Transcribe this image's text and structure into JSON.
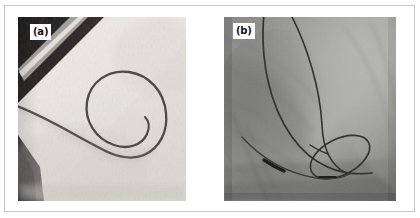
{
  "figure": {
    "panel_a": {
      "label": "(a)",
      "description": "pigtail catheter laid on a light surgical drape",
      "background_color": "#e7e4e0",
      "catheter_color": "#4a4642",
      "dark_band_color": "#1d1c1b"
    },
    "panel_b": {
      "label": "(b)",
      "description": "fluoroscopic image of catheter in situ with radiopaque markers",
      "background_color": "#8d8d8a",
      "catheter_color": "#2b2a29",
      "marker_color": "#141414"
    },
    "frame_color": "#c8c8c8",
    "page_background": "#ffffff"
  }
}
